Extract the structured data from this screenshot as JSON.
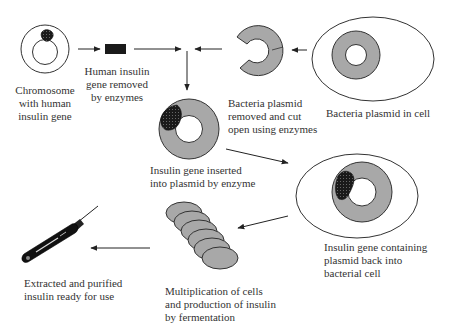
{
  "diagram": {
    "colors": {
      "plasmid_fill": "#a8a8a8",
      "outline": "#333333",
      "gene": "#1a1a1a",
      "cell_fill": "#ffffff",
      "arrow": "#222222"
    },
    "nodes": [
      {
        "id": "chromosome",
        "icon": "chromosome-with-gene-icon",
        "label": "Chromosome\nwith human\ninsulin gene"
      },
      {
        "id": "gene",
        "icon": "insulin-gene-block-icon",
        "label": "Human insulin\ngene removed\nby enzymes"
      },
      {
        "id": "cut_plasmid",
        "icon": "cut-plasmid-icon",
        "label": "Bacteria plasmid\nremoved and cut\nopen using enzymes"
      },
      {
        "id": "plasmid_in_cell",
        "icon": "plasmid-in-cell-icon",
        "label": "Bacteria plasmid in cell"
      },
      {
        "id": "recombinant_plasmid",
        "icon": "recombinant-plasmid-icon",
        "label": "Insulin gene inserted\ninto plasmid by enzyme"
      },
      {
        "id": "recombinant_cell",
        "icon": "recombinant-cell-icon",
        "label": "Insulin gene containing\nplasmid back into\nbacterial cell"
      },
      {
        "id": "fermentation",
        "icon": "multiplying-cells-icon",
        "label": "Multiplication of cells\nand production of insulin\nby fermentation"
      },
      {
        "id": "insulin_pen",
        "icon": "insulin-pen-icon",
        "label": "Extracted and purified\ninsulin ready for use"
      }
    ],
    "edges": [
      {
        "from": "chromosome",
        "to": "gene"
      },
      {
        "from": "gene",
        "to": "recombinant_plasmid"
      },
      {
        "from": "plasmid_in_cell",
        "to": "cut_plasmid"
      },
      {
        "from": "cut_plasmid",
        "to": "recombinant_plasmid"
      },
      {
        "from": "recombinant_plasmid",
        "to": "recombinant_cell"
      },
      {
        "from": "recombinant_cell",
        "to": "fermentation"
      },
      {
        "from": "fermentation",
        "to": "insulin_pen"
      }
    ]
  }
}
